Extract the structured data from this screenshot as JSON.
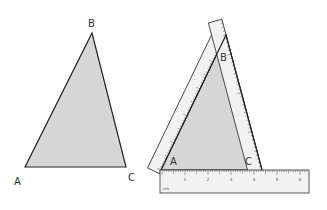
{
  "figure": {
    "left_triangle": {
      "vertices": {
        "A": {
          "label": "A",
          "x": 25,
          "y": 167,
          "label_x": 14,
          "label_y": 185
        },
        "B": {
          "label": "B",
          "x": 92,
          "y": 33,
          "label_x": 88,
          "label_y": 27
        },
        "C": {
          "label": "C",
          "x": 126,
          "y": 167,
          "label_x": 128,
          "label_y": 181
        }
      }
    },
    "right_triangle": {
      "vertices": {
        "A": {
          "label": "A",
          "x": 161,
          "y": 170,
          "label_x": 170,
          "label_y": 165
        },
        "B": {
          "label": "B",
          "x": 226,
          "y": 35,
          "label_x": 220,
          "label_y": 61
        },
        "C": {
          "label": "C",
          "x": 262,
          "y": 170,
          "label_x": 245,
          "label_y": 165
        }
      }
    },
    "rulers": {
      "bottom": {
        "unit": "cm",
        "numbers": [
          "1",
          "2",
          "3",
          "4",
          "5",
          "6"
        ]
      },
      "left": {
        "unit": "cm"
      },
      "right": {
        "unit": "cm"
      }
    },
    "colors": {
      "triangle_fill": "#d6d6d6",
      "stroke": "#222222",
      "ruler_fill": "#f2f2f2",
      "label": "#333333"
    }
  }
}
